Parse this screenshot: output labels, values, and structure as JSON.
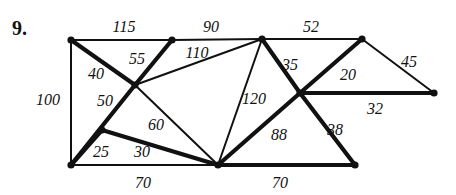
{
  "figure": {
    "problem_number": "9.",
    "width": 456,
    "height": 195,
    "background_color": "#ffffff",
    "ink_color": "#111111"
  },
  "chart_data": {
    "type": "diagram",
    "subtype": "weighted-graph-network",
    "title": "",
    "nodes": [
      {
        "id": "A",
        "label": "",
        "x": 71,
        "y": 40
      },
      {
        "id": "B",
        "label": "",
        "x": 172,
        "y": 40
      },
      {
        "id": "C",
        "label": "",
        "x": 262,
        "y": 39
      },
      {
        "id": "D",
        "label": "",
        "x": 362,
        "y": 39
      },
      {
        "id": "E",
        "label": "",
        "x": 434,
        "y": 93
      },
      {
        "id": "F",
        "label": "",
        "x": 300,
        "y": 93
      },
      {
        "id": "G",
        "label": "",
        "x": 135,
        "y": 85
      },
      {
        "id": "H",
        "label": "",
        "x": 102,
        "y": 130
      },
      {
        "id": "I",
        "label": "",
        "x": 71,
        "y": 165
      },
      {
        "id": "J",
        "label": "",
        "x": 218,
        "y": 165
      },
      {
        "id": "K",
        "label": "",
        "x": 355,
        "y": 165
      }
    ],
    "edges": [
      {
        "from": "A",
        "to": "B",
        "weight": 115,
        "thick": false,
        "label_x": 124,
        "label_y": 27
      },
      {
        "from": "B",
        "to": "C",
        "weight": 90,
        "thick": false,
        "label_x": 211,
        "label_y": 27
      },
      {
        "from": "C",
        "to": "D",
        "weight": 52,
        "thick": false,
        "label_x": 311,
        "label_y": 27
      },
      {
        "from": "D",
        "to": "E",
        "weight": 45,
        "thick": false,
        "label_x": 409,
        "label_y": 62
      },
      {
        "from": "F",
        "to": "E",
        "weight": 32,
        "thick": true,
        "label_x": 375,
        "label_y": 109
      },
      {
        "from": "D",
        "to": "F",
        "weight": 20,
        "thick": true,
        "label_x": 348,
        "label_y": 75
      },
      {
        "from": "C",
        "to": "F",
        "weight": 35,
        "thick": true,
        "label_x": 290,
        "label_y": 65
      },
      {
        "from": "C",
        "to": "G",
        "weight": 110,
        "thick": false,
        "label_x": 197,
        "label_y": 53
      },
      {
        "from": "B",
        "to": "G",
        "weight": 55,
        "thick": true,
        "label_x": 137,
        "label_y": 59
      },
      {
        "from": "A",
        "to": "G",
        "weight": 40,
        "thick": true,
        "label_x": 96,
        "label_y": 74
      },
      {
        "from": "A",
        "to": "I",
        "weight": 100,
        "thick": false,
        "label_x": 48,
        "label_y": 100
      },
      {
        "from": "G",
        "to": "I",
        "weight": 50,
        "thick": true,
        "label_x": 105,
        "label_y": 101
      },
      {
        "from": "H",
        "to": "I",
        "weight": 25,
        "thick": true,
        "label_x": 101,
        "label_y": 152
      },
      {
        "from": "H",
        "to": "J",
        "weight": 30,
        "thick": true,
        "label_x": 142,
        "label_y": 152
      },
      {
        "from": "G",
        "to": "J",
        "weight": 60,
        "thick": false,
        "label_x": 156,
        "label_y": 125
      },
      {
        "from": "C",
        "to": "J",
        "weight": 120,
        "thick": false,
        "label_x": 254,
        "label_y": 99
      },
      {
        "from": "J",
        "to": "F",
        "weight": 88,
        "thick": true,
        "label_x": 279,
        "label_y": 135
      },
      {
        "from": "F",
        "to": "K",
        "weight": 38,
        "thick": true,
        "label_x": 335,
        "label_y": 130
      },
      {
        "from": "I",
        "to": "J",
        "weight": 70,
        "thick": false,
        "label_x": 143,
        "label_y": 183
      },
      {
        "from": "J",
        "to": "K",
        "weight": 70,
        "thick": true,
        "label_x": 280,
        "label_y": 183
      }
    ],
    "edge_labels": [
      "115",
      "90",
      "52",
      "45",
      "32",
      "20",
      "35",
      "110",
      "55",
      "40",
      "100",
      "50",
      "25",
      "30",
      "60",
      "120",
      "88",
      "38",
      "70",
      "70"
    ],
    "node_count": 11,
    "edge_count": 20
  }
}
